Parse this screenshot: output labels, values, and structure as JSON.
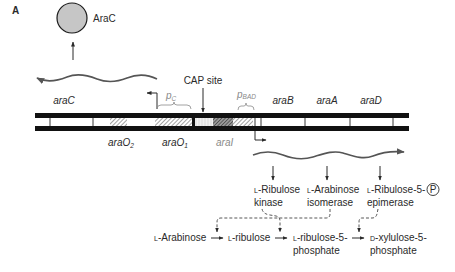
{
  "panel_label": "A",
  "protein_label": "AraC",
  "cap_site_label": "CAP site",
  "promoters": {
    "pc": {
      "letter": "p",
      "subscript": "C"
    },
    "pbad": {
      "letter": "p",
      "subscript": "BAD"
    }
  },
  "genes": {
    "araC": "araC",
    "araB": "araB",
    "araA": "araA",
    "araD": "araD"
  },
  "sites": {
    "araO2": {
      "name": "araO",
      "subscript": "2"
    },
    "araO1": {
      "name": "araO",
      "subscript": "1"
    },
    "araI": {
      "name": "araI"
    }
  },
  "enzymes": [
    {
      "prefix": "L",
      "line1": "-Ribulose",
      "line2": "kinase"
    },
    {
      "prefix": "L",
      "line1": "-Arabinose",
      "line2": "isomerase"
    },
    {
      "prefix": "L",
      "line1": "-Ribulose-5-",
      "badge": "P",
      "line2": "epimerase"
    }
  ],
  "pathway": [
    {
      "prefix": "L",
      "line1": "-Arabinose"
    },
    {
      "prefix": "L",
      "line1": "-ribulose"
    },
    {
      "prefix": "L",
      "line1": "-ribulose-5-",
      "line2": "phosphate"
    },
    {
      "prefix": "D",
      "line1": "-xylulose-5-",
      "line2": "phosphate"
    }
  ],
  "colors": {
    "protein_fill": "#c6c6c6",
    "promoter_label": "#8a8a8a",
    "dna": "#111111"
  }
}
